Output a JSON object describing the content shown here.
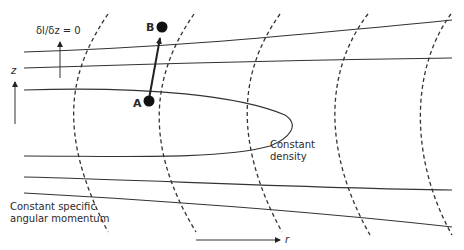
{
  "diagram": {
    "title": "",
    "labels": {
      "gradient_condition": "δl/δz = 0",
      "z_axis": "z",
      "r_axis": "r",
      "point_a": "A",
      "point_b": "B",
      "density_line1": "Constant",
      "density_line2": "density",
      "angmom_line1": "Constant specific",
      "angmom_line2": "angular momentum"
    },
    "colors": {
      "stroke": "#333333",
      "text": "#2a2a2a",
      "background": "#ffffff"
    },
    "points": [
      {
        "name": "A",
        "x": 148,
        "y": 101
      },
      {
        "name": "B",
        "x": 162,
        "y": 26
      }
    ]
  }
}
